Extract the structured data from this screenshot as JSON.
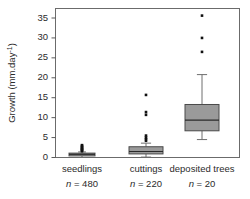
{
  "chart_data": {
    "type": "box",
    "title": "",
    "xlabel": "",
    "ylabel": "Growth (mm.day⁻¹)",
    "ylabel_base": "Growth (mm.day",
    "ylabel_exponent": "-1",
    "ylabel_close": ")",
    "ylim": [
      0,
      37
    ],
    "yticks": [
      0,
      5,
      10,
      15,
      20,
      25,
      30,
      35
    ],
    "ytick_labels": [
      "0",
      "5",
      "10",
      "15",
      "20",
      "25",
      "30",
      "35"
    ],
    "grid": false,
    "legend": "none",
    "frame": true,
    "categories": [
      "seedlings",
      "cuttings",
      "deposited trees"
    ],
    "sample_sizes": [
      "n = 480",
      "n = 220",
      "n = 20"
    ],
    "sample_size_values": [
      480,
      220,
      20
    ],
    "box_fill_color": "#9a9a9a",
    "box_edge_color": "#4a4a4a",
    "outlier_color": "#111111",
    "series": [
      {
        "name": "seedlings",
        "n": 480,
        "whisker_low": 0.0,
        "q1": 0.4,
        "median": 0.8,
        "q3": 1.1,
        "whisker_high": 1.4,
        "outliers": [
          1.6,
          1.8,
          2.0,
          2.2,
          2.4,
          2.6,
          2.9,
          3.1
        ]
      },
      {
        "name": "cuttings",
        "n": 220,
        "whisker_low": 0.1,
        "q1": 0.9,
        "median": 1.5,
        "q3": 2.7,
        "whisker_high": 3.6,
        "outliers": [
          4.2,
          4.6,
          5.0,
          5.5,
          10.7,
          11.4,
          15.7
        ]
      },
      {
        "name": "deposited trees",
        "n": 20,
        "whisker_low": 4.5,
        "q1": 6.7,
        "median": 9.4,
        "q3": 13.3,
        "whisker_high": 20.8,
        "outliers": [
          26.5,
          30.0,
          35.6
        ]
      }
    ]
  }
}
